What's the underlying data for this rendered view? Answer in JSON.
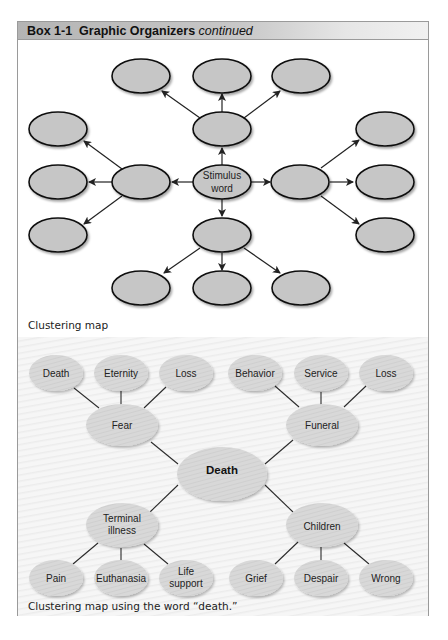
{
  "header": {
    "box_label": "Box 1-1",
    "title": "Graphic Organizers",
    "suffix": "continued"
  },
  "clustering_map": {
    "caption": "Clustering map",
    "center_label_line1": "Stimulus",
    "center_label_line2": "word",
    "fill_color": "#c6c6c6",
    "stroke_color": "#111111"
  },
  "death_map": {
    "caption": "Clustering map using the word “death.”",
    "center": "Death",
    "branches": [
      {
        "label": "Fear",
        "children": [
          "Death",
          "Eternity",
          "Loss"
        ]
      },
      {
        "label": "Funeral",
        "children": [
          "Behavior",
          "Service",
          "Loss"
        ]
      },
      {
        "label_line1": "Terminal",
        "label_line2": "illness",
        "children": [
          "Pain",
          "Euthanasia",
          "Life support"
        ],
        "child3_line1": "Life",
        "child3_line2": "support"
      },
      {
        "label": "Children",
        "children": [
          "Grief",
          "Despair",
          "Wrong"
        ]
      }
    ],
    "fill_color": "#d9d9d9"
  }
}
